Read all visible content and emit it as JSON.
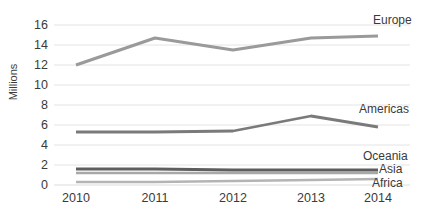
{
  "chart_data": {
    "type": "line",
    "title": "",
    "xlabel": "",
    "ylabel": "Millions",
    "categories": [
      "2010",
      "2011",
      "2012",
      "2013",
      "2014"
    ],
    "x": [
      2010,
      2011,
      2012,
      2013,
      2014
    ],
    "ylim": [
      0,
      16
    ],
    "yticks": [
      0,
      2,
      4,
      6,
      8,
      10,
      12,
      14,
      16
    ],
    "ytick_labels": [
      "0",
      "2",
      "4",
      "6",
      "8",
      "10",
      "12",
      "14",
      "16"
    ],
    "grid": true,
    "grid_axis": "y",
    "legend_position": "right-inline",
    "series": [
      {
        "name": "Europe",
        "values": [
          12.0,
          14.7,
          13.5,
          14.7,
          14.9
        ],
        "color": "#9a9a9a"
      },
      {
        "name": "Americas",
        "values": [
          5.3,
          5.3,
          5.4,
          6.9,
          5.8
        ],
        "color": "#7a7a7a"
      },
      {
        "name": "Oceania",
        "values": [
          1.2,
          1.2,
          1.2,
          1.2,
          1.2
        ],
        "color": "#a8a8a8"
      },
      {
        "name": "Asia",
        "values": [
          1.6,
          1.6,
          1.5,
          1.5,
          1.5
        ],
        "color": "#5e5e5e"
      },
      {
        "name": "Africa",
        "values": [
          0.3,
          0.3,
          0.4,
          0.5,
          0.6
        ],
        "color": "#b4b4b4"
      }
    ],
    "colors": {
      "gridline": "#e2e2e2",
      "text": "#3a3a3a",
      "background": "#ffffff"
    }
  }
}
